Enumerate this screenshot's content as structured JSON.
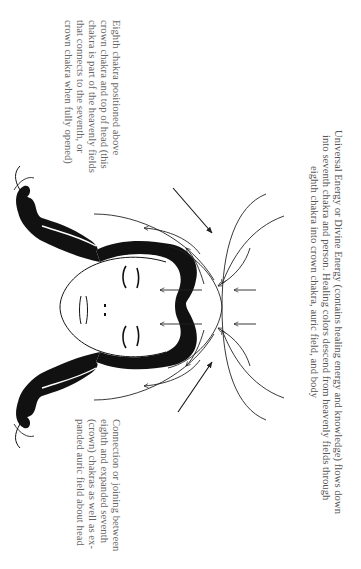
{
  "figure": {
    "orientation": "rotated 90 degrees clockwise",
    "colors": {
      "background": "#ffffff",
      "ink": "#111111",
      "text": "#555555"
    }
  },
  "labels": {
    "universal_energy": {
      "lines": [
        "Universal Energy or Divine Energy (contains healing energy and knowledge) flows down",
        "into seventh chakra and person. Healing colors descend from heavenly fields through",
        "eighth chakra into crown chakra, auric field, and body"
      ]
    },
    "eighth_chakra": {
      "lines": [
        "Eighth chakra positioned above",
        "crown chakra and top of head (this",
        "chakra is part of the heavenly fields",
        "that connects to the seventh, or",
        "crown chakra when fully opened)"
      ]
    },
    "connection": {
      "lines": [
        "Connection or joining between",
        "eighth and expanded seventh",
        "(crown) chakras as well as ex-",
        "panded auric field about head"
      ]
    }
  }
}
